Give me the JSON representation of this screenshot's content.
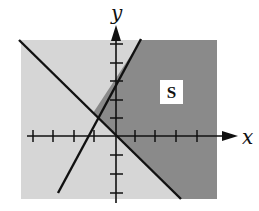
{
  "diagram": {
    "type": "linear-inequality-graph",
    "axes": {
      "x_label": "x",
      "y_label": "y",
      "x_ticks": [
        -4,
        -3,
        -2,
        -1,
        1,
        2,
        3,
        4
      ],
      "y_ticks": [
        -3,
        -2,
        -1,
        1,
        2,
        3,
        4,
        5
      ],
      "tick_labels_shown": false
    },
    "lines": [
      {
        "name": "boundary-ascending",
        "equation": "y = 1.5x + 3"
      },
      {
        "name": "boundary-descending",
        "equation": "y = -x"
      }
    ],
    "intersection": {
      "x": -1.2,
      "y": 1.2
    },
    "region": {
      "label": "S",
      "description": "dark shaded region: y <= 1.5x + 3 and y >= -x"
    },
    "colors": {
      "dark_shade": "#8a8a8a",
      "light_shade": "#d6d6d6",
      "lines": "#111111",
      "label_box": "#ffffff"
    }
  }
}
